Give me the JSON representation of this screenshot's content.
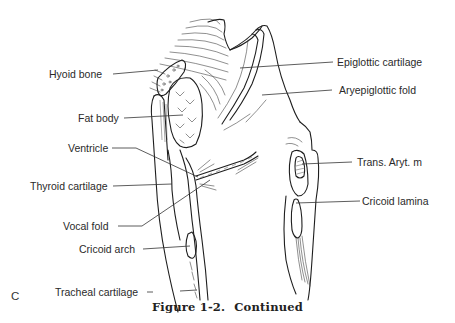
{
  "figure": {
    "panel_letter": "C",
    "caption_number": "Figure 1-2.",
    "caption_text": "Continued",
    "labels": {
      "hyoid_bone": "Hyoid bone",
      "fat_body": "Fat body",
      "ventricle": "Ventricle",
      "thyroid_cartilage": "Thyroid cartilage",
      "vocal_fold": "Vocal fold",
      "cricoid_arch": "Cricoid arch",
      "tracheal_cartilage": "Tracheal cartilage",
      "epiglottic_cartilage": "Epiglottic cartilage",
      "aryepiglottic_fold": "Aryepiglottic fold",
      "trans_aryt_m": "Trans. Aryt. m",
      "cricoid_lamina": "Cricoid lamina"
    },
    "colors": {
      "line": "#1e1e1e",
      "text": "#2a2a2a",
      "background": "#ffffff"
    }
  }
}
